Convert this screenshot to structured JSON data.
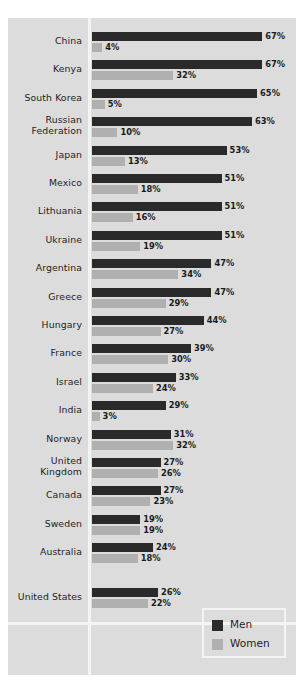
{
  "chart_data": {
    "type": "bar",
    "orientation": "horizontal",
    "title": "",
    "xlabel": "",
    "ylabel": "",
    "xlim": [
      0,
      70
    ],
    "grid": false,
    "legend_position": "bottom-right",
    "categories": [
      "China",
      "Kenya",
      "South Korea",
      "Russian Federation",
      "Japan",
      "Mexico",
      "Lithuania",
      "Ukraine",
      "Argentina",
      "Greece",
      "Hungary",
      "France",
      "Israel",
      "India",
      "Norway",
      "United Kingdom",
      "Canada",
      "Sweden",
      "Australia",
      "United States"
    ],
    "series": [
      {
        "name": "Men",
        "color": "#2a2a2a",
        "values": [
          67,
          67,
          65,
          63,
          53,
          51,
          51,
          51,
          47,
          47,
          44,
          39,
          33,
          29,
          31,
          27,
          27,
          19,
          24,
          26
        ],
        "labels": [
          "67%",
          "67%",
          "65%",
          "63%",
          "53%",
          "51%",
          "51%",
          "51%",
          "47%",
          "47%",
          "44%",
          "39%",
          "33%",
          "29%",
          "31%",
          "27%",
          "27%",
          "19%",
          "24%",
          "26%"
        ]
      },
      {
        "name": "Women",
        "color": "#b0b0b0",
        "values": [
          4,
          32,
          5,
          10,
          13,
          18,
          16,
          19,
          34,
          29,
          27,
          30,
          24,
          3,
          32,
          26,
          23,
          19,
          18,
          22
        ],
        "labels": [
          "4%",
          "32%",
          "5%",
          "10%",
          "13%",
          "18%",
          "16%",
          "19%",
          "34%",
          "29%",
          "27%",
          "30%",
          "24%",
          "3%",
          "32%",
          "26%",
          "23%",
          "19%",
          "18%",
          "22%"
        ]
      }
    ],
    "separated_category": "United States"
  },
  "legend": {
    "entries": [
      {
        "label": "Men"
      },
      {
        "label": "Women"
      }
    ]
  },
  "colors": {
    "panel_background": "#dcdcdc",
    "divider": "#f4f4f4",
    "men_bar": "#2a2a2a",
    "women_bar": "#b0b0b0",
    "text": "#1c1c1c"
  }
}
